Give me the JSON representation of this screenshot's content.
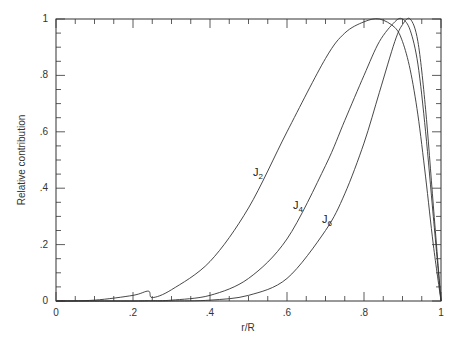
{
  "chart_data": {
    "type": "line",
    "title": "",
    "xlabel": "r/R",
    "ylabel": "Relative contribution",
    "xlim": [
      0,
      1
    ],
    "ylim": [
      0,
      1
    ],
    "grid": false,
    "legend": "none (inline curve labels)",
    "x_ticks": [
      "0",
      ".2",
      ".4",
      ".6",
      ".8",
      "1"
    ],
    "y_ticks": [
      "0",
      ".2",
      ".4",
      ".6",
      ".8",
      "1"
    ],
    "x": [
      0,
      0.1,
      0.2,
      0.24,
      0.25,
      0.3,
      0.4,
      0.5,
      0.6,
      0.7,
      0.75,
      0.8,
      0.84,
      0.88,
      0.9,
      0.92,
      0.94,
      0.96,
      0.98,
      1.0
    ],
    "series": [
      {
        "name": "J2",
        "label": "J",
        "subscript": "2",
        "values": [
          0,
          0.003,
          0.02,
          0.035,
          0.012,
          0.04,
          0.14,
          0.33,
          0.6,
          0.86,
          0.95,
          0.99,
          1.0,
          0.97,
          0.92,
          0.82,
          0.66,
          0.44,
          0.2,
          0
        ]
      },
      {
        "name": "J4",
        "label": "J",
        "subscript": "4",
        "values": [
          0,
          0,
          0,
          0.001,
          0.001,
          0.003,
          0.02,
          0.08,
          0.22,
          0.48,
          0.64,
          0.8,
          0.92,
          0.99,
          1.0,
          0.96,
          0.84,
          0.6,
          0.3,
          0
        ]
      },
      {
        "name": "J6",
        "label": "J",
        "subscript": "6",
        "values": [
          0,
          0,
          0,
          0,
          0,
          0,
          0.003,
          0.02,
          0.08,
          0.25,
          0.38,
          0.56,
          0.74,
          0.92,
          0.98,
          1.0,
          0.92,
          0.68,
          0.34,
          0
        ]
      }
    ],
    "annotations": [
      {
        "text": "J2",
        "x": 0.52,
        "y": 0.46
      },
      {
        "text": "J4",
        "x": 0.63,
        "y": 0.34
      },
      {
        "text": "J6",
        "x": 0.7,
        "y": 0.29
      }
    ]
  },
  "labels": {
    "xlabel": "r/R",
    "ylabel": "Relative contribution",
    "j": "J",
    "j2_sub": "2",
    "j4_sub": "4",
    "j6_sub": "6"
  }
}
